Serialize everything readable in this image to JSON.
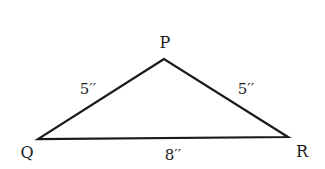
{
  "diagram": {
    "type": "triangle",
    "vertices": {
      "P": {
        "label": "P",
        "x": 164,
        "y": 59
      },
      "Q": {
        "label": "Q",
        "x": 38,
        "y": 139
      },
      "R": {
        "label": "R",
        "x": 288,
        "y": 137
      }
    },
    "sides": {
      "PQ": {
        "label": "5′′",
        "length": 5,
        "unit": "inches"
      },
      "PR": {
        "label": "5′′",
        "length": 5,
        "unit": "inches"
      },
      "QR": {
        "label": "8′′",
        "length": 8,
        "unit": "inches"
      }
    },
    "stroke_color": "#1a1a1a",
    "background": "#ffffff"
  }
}
